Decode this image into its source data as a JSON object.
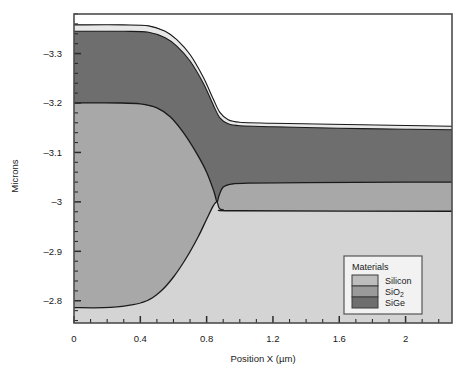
{
  "figure": {
    "background_color": "#ffffff",
    "frame_color": "#4d4d4d",
    "plot_background_color": "#ffffff"
  },
  "axes": {
    "y_title": "Microns",
    "x_title": "Position X (µm)",
    "x_ticks": [
      "0",
      "0.4",
      "0.8",
      "1.2",
      "1.6",
      "2"
    ],
    "x_tick_values": [
      0,
      0.4,
      0.8,
      1.2,
      1.6,
      2
    ],
    "x_minor_count_between": 3,
    "x_range": [
      0,
      2.28
    ],
    "y_ticks": [
      "–3.3",
      "–3.2",
      "–3.1",
      "–3",
      "–2.9",
      "–2.8"
    ],
    "y_tick_values": [
      -3.3,
      -3.2,
      -3.1,
      -3.0,
      -2.9,
      -2.8
    ],
    "y_minor_count_between": 4,
    "y_range": [
      -3.38,
      -2.755
    ],
    "y_inverted": true
  },
  "legend": {
    "title": "Materials",
    "entries": [
      {
        "label": "Silicon",
        "sub": "",
        "color": "#bdbdbd"
      },
      {
        "label": "SiO",
        "sub": "2",
        "color": "#9a9a9a"
      },
      {
        "label": "SiGe",
        "sub": "",
        "color": "#6e6e6e"
      }
    ],
    "border_color": "#555555",
    "background_color": "#f2f2f2"
  },
  "chart_data": {
    "type": "area",
    "title": "",
    "xlabel": "Position X (µm)",
    "ylabel": "Microns",
    "xlim": [
      0,
      2.28
    ],
    "ylim": [
      -3.38,
      -2.755
    ],
    "y_inverted": true,
    "grid": false,
    "legend_position": "bottom-right",
    "materials": [
      "Silicon",
      "SiO2",
      "SiGe"
    ],
    "colors": {
      "Silicon": "#d4d4d4",
      "SiO2": "#6e6e6e",
      "SiGe": "#a8a8a8",
      "thin_film": "#e8e8e8"
    },
    "interfaces": [
      {
        "name": "top-surface-SiO2",
        "comment": "Upper boundary of the dark SiO2 layer (outer oxide top).",
        "points": [
          [
            0.0,
            -3.345
          ],
          [
            0.3,
            -3.345
          ],
          [
            0.45,
            -3.343
          ],
          [
            0.55,
            -3.332
          ],
          [
            0.62,
            -3.315
          ],
          [
            0.7,
            -3.285
          ],
          [
            0.78,
            -3.24
          ],
          [
            0.84,
            -3.196
          ],
          [
            0.88,
            -3.17
          ],
          [
            0.93,
            -3.158
          ],
          [
            1.0,
            -3.154
          ],
          [
            1.2,
            -3.152
          ],
          [
            1.6,
            -3.149
          ],
          [
            2.0,
            -3.147
          ],
          [
            2.28,
            -3.146
          ]
        ]
      },
      {
        "name": "thin-film-top",
        "comment": "Thin light film sitting just above the SiO2 body on the left plateau.",
        "points": [
          [
            0.0,
            -3.358
          ],
          [
            0.3,
            -3.358
          ],
          [
            0.45,
            -3.356
          ],
          [
            0.55,
            -3.345
          ],
          [
            0.62,
            -3.328
          ],
          [
            0.7,
            -3.298
          ],
          [
            0.78,
            -3.252
          ],
          [
            0.84,
            -3.208
          ],
          [
            0.88,
            -3.181
          ],
          [
            0.93,
            -3.166
          ],
          [
            1.0,
            -3.161
          ],
          [
            1.2,
            -3.159
          ],
          [
            2.28,
            -3.153
          ]
        ]
      },
      {
        "name": "SiO2-SiGe-interface",
        "comment": "Boundary between dark SiO2 above and the mid-gray SiGe plateau below on the left.",
        "points": [
          [
            0.0,
            -3.2
          ],
          [
            0.28,
            -3.2
          ],
          [
            0.4,
            -3.198
          ],
          [
            0.5,
            -3.19
          ],
          [
            0.58,
            -3.172
          ],
          [
            0.66,
            -3.14
          ],
          [
            0.74,
            -3.098
          ],
          [
            0.8,
            -3.06
          ],
          [
            0.845,
            -3.02
          ],
          [
            0.862,
            -3.0
          ],
          [
            0.875,
            -3.013
          ],
          [
            0.9,
            -3.03
          ],
          [
            0.95,
            -3.036
          ],
          [
            1.05,
            -3.038
          ],
          [
            1.4,
            -3.039
          ],
          [
            2.0,
            -3.04
          ],
          [
            2.28,
            -3.04
          ]
        ]
      },
      {
        "name": "SiGe-Silicon-interface",
        "comment": "Lower boundary of the mid-gray SiGe region meeting the light Silicon substrate.",
        "points": [
          [
            0.0,
            -2.786
          ],
          [
            0.18,
            -2.786
          ],
          [
            0.32,
            -2.79
          ],
          [
            0.44,
            -2.8
          ],
          [
            0.52,
            -2.818
          ],
          [
            0.6,
            -2.848
          ],
          [
            0.68,
            -2.888
          ],
          [
            0.75,
            -2.93
          ],
          [
            0.8,
            -2.965
          ],
          [
            0.84,
            -2.992
          ],
          [
            0.862,
            -3.0
          ],
          [
            0.875,
            -2.988
          ],
          [
            0.9,
            -2.984
          ],
          [
            1.0,
            -2.982
          ],
          [
            2.28,
            -2.981
          ]
        ]
      }
    ]
  }
}
